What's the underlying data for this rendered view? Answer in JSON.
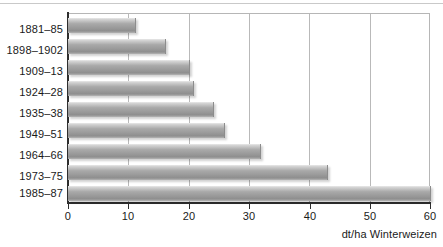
{
  "chart_data": {
    "type": "bar",
    "orientation": "horizontal",
    "title": "",
    "subtitle": "",
    "xlabel": "dt/ha Winterweizen",
    "ylabel": "",
    "categories": [
      "1881–85",
      "1898–1902",
      "1909–13",
      "1924–28",
      "1935–38",
      "1949–51",
      "1964–66",
      "1973–75",
      "1985–87"
    ],
    "values": [
      11.1,
      16.1,
      20.0,
      20.8,
      24.1,
      25.8,
      31.8,
      43.0,
      60.0
    ],
    "series": [
      {
        "name": "Winterweizen-Ertrag",
        "values": [
          11.1,
          16.1,
          20.0,
          20.8,
          24.1,
          25.8,
          31.8,
          43.0,
          60.0
        ]
      }
    ],
    "xlim": [
      0,
      60
    ],
    "xticks": [
      0,
      10,
      20,
      30,
      40,
      50,
      60
    ],
    "xtick_labels": [
      "0",
      "10",
      "20",
      "30",
      "40",
      "50",
      "60"
    ],
    "gridlines": "vertical",
    "grid": true,
    "legend": false,
    "legend_position": "none",
    "bar_color": "#a0a0a0",
    "axis_color": "#2e2e2e",
    "grid_color": "#b9b9b9"
  }
}
